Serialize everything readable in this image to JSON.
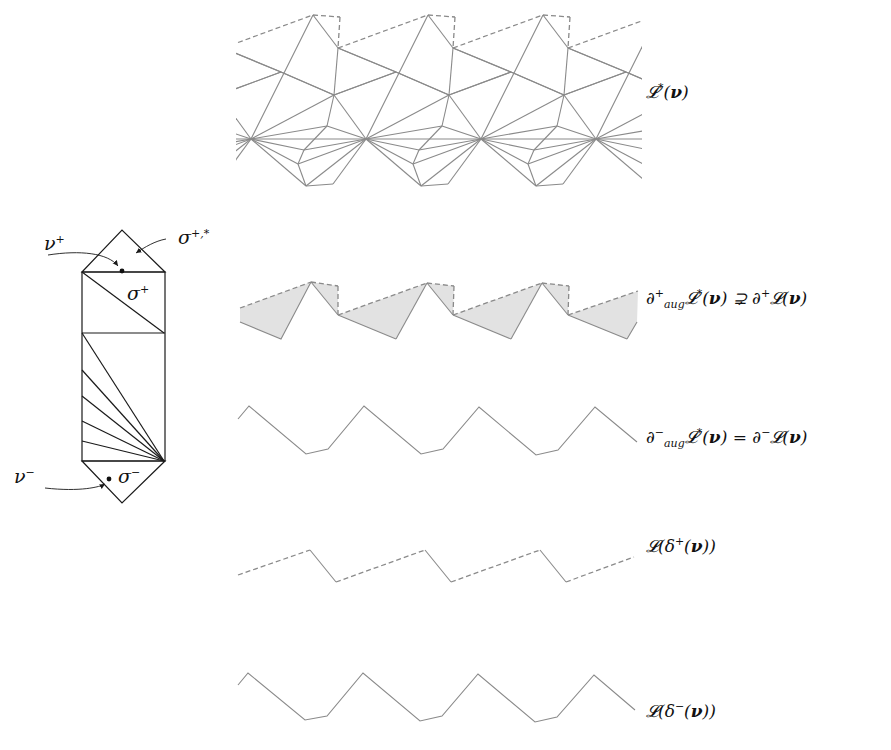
{
  "figure": {
    "colors": {
      "mesh": "#8a8a8a",
      "shade": "#e2e2e2",
      "ink": "#1a1a1a"
    }
  },
  "prism": {
    "labels": {
      "nu_plus": "ν⁺",
      "sigma_plus_star": "σ⁺,*",
      "sigma_plus": "σ⁺",
      "nu_minus": "ν⁻",
      "sigma_minus": "σ⁻"
    },
    "geometry": {
      "top_apex": [
        122,
        230
      ],
      "rect_top": 272,
      "rect_left": 82,
      "rect_right": 165,
      "mid_y": 333,
      "rect_bottom": 461,
      "bottom_apex": [
        122,
        503
      ],
      "fan_hub": [
        164,
        461
      ],
      "fan_targets_y": [
        370,
        396,
        421,
        441
      ],
      "upper_diag": [
        [
          82,
          272
        ],
        [
          164,
          333
        ]
      ],
      "nu_plus_dot": [
        122,
        271
      ],
      "nu_minus_dot": [
        109,
        479
      ]
    }
  },
  "rows": [
    {
      "id": "L-star",
      "label_html": "𝓛<sup>*</sup>(<b>ν</b>)",
      "label_pos": [
        646,
        82
      ]
    },
    {
      "id": "boundary-plus",
      "label_html": "∂<sup>+</sup><sub><i>aug</i></sub>𝓛<sup>*</sup>(<b>ν</b>) ⊋ ∂<sup>+</sup>𝓛(<b>ν</b>)",
      "label_pos": [
        646,
        288
      ]
    },
    {
      "id": "boundary-minus",
      "label_html": "∂<sup>−</sup><sub><i>aug</i></sub>𝓛<sup>*</sup>(<b>ν</b>) = ∂<sup>−</sup>𝓛(<b>ν</b>)",
      "label_pos": [
        646,
        427
      ]
    },
    {
      "id": "delta-plus",
      "label_html": "𝓛(δ<sup>+</sup>(<b>ν</b>))",
      "label_pos": [
        646,
        536
      ]
    },
    {
      "id": "delta-minus",
      "label_html": "𝓛(δ<sup>−</sup>(<b>ν</b>))",
      "label_pos": [
        646,
        701
      ]
    }
  ],
  "labels_text": {
    "L_star": "L*(ν)",
    "boundary_plus": "∂⁺_aug L*(ν) ⊋ ∂⁺ L(ν)",
    "boundary_minus": "∂⁻_aug L*(ν) = ∂⁻ L(ν)",
    "delta_plus": "L(δ⁺(ν))",
    "delta_minus": "L(δ⁻(ν))"
  },
  "geometry": {
    "period": 115,
    "x_start": 238,
    "x_end": 641,
    "top_mesh_period_origin": 251,
    "shade_band": {
      "peaks": [
        [
          311,
          282
        ],
        [
          427,
          283
        ],
        [
          542,
          283
        ]
      ],
      "corners_top": [
        [
          338,
          286
        ],
        [
          454,
          286
        ],
        [
          569,
          286
        ]
      ],
      "valleys": [
        [
          338,
          315
        ],
        [
          453,
          315
        ],
        [
          568,
          315
        ]
      ],
      "bottoms": [
        [
          281,
          339
        ],
        [
          396,
          339
        ],
        [
          511,
          339
        ],
        [
          627,
          339
        ]
      ],
      "left_start": [
        240,
        308
      ],
      "right_end_top": [
        638,
        291
      ],
      "right_end_bottom": [
        637,
        322
      ]
    },
    "minus_boundary": [
      [
        238,
        419
      ],
      [
        249,
        406
      ],
      [
        306,
        454
      ],
      [
        328,
        449
      ],
      [
        364,
        406
      ],
      [
        421,
        454
      ],
      [
        443,
        449
      ],
      [
        479,
        407
      ],
      [
        536,
        455
      ],
      [
        558,
        450
      ],
      [
        595,
        407
      ],
      [
        637,
        442
      ]
    ],
    "delta_plus": {
      "dashed": [
        [
          [
            238,
            575
          ],
          [
            310,
            550
          ]
        ],
        [
          [
            336,
            582
          ],
          [
            425,
            550
          ]
        ],
        [
          [
            451,
            582
          ],
          [
            540,
            550
          ]
        ],
        [
          [
            566,
            582
          ],
          [
            634,
            557
          ]
        ]
      ],
      "solid": [
        [
          [
            310,
            550
          ],
          [
            336,
            582
          ]
        ],
        [
          [
            425,
            550
          ],
          [
            451,
            582
          ]
        ],
        [
          [
            540,
            550
          ],
          [
            566,
            582
          ]
        ]
      ]
    },
    "delta_minus": [
      [
        238,
        685
      ],
      [
        248,
        673
      ],
      [
        305,
        720
      ],
      [
        327,
        716
      ],
      [
        363,
        673
      ],
      [
        420,
        721
      ],
      [
        442,
        716
      ],
      [
        478,
        674
      ],
      [
        535,
        722
      ],
      [
        557,
        717
      ],
      [
        594,
        675
      ],
      [
        635,
        710
      ]
    ]
  }
}
